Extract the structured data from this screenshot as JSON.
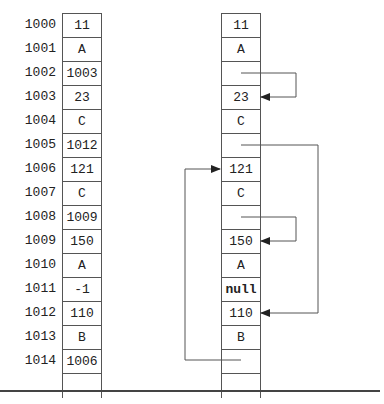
{
  "diagram": {
    "title": "",
    "addresses": [
      "1000",
      "1001",
      "1002",
      "1003",
      "1004",
      "1005",
      "1006",
      "1007",
      "1008",
      "1009",
      "1010",
      "1011",
      "1012",
      "1013",
      "1014"
    ],
    "left_column": {
      "cells": [
        "11",
        "A",
        "1003",
        "23",
        "C",
        "1012",
        "121",
        "C",
        "1009",
        "150",
        "A",
        "-1",
        "110",
        "B",
        "1006"
      ]
    },
    "right_column": {
      "cells": [
        "11",
        "A",
        "",
        "23",
        "C",
        "",
        "121",
        "C",
        "",
        "150",
        "A",
        "null",
        "110",
        "B",
        ""
      ],
      "pointers": [
        {
          "from_address": "1002",
          "to_address": "1003",
          "side": "right"
        },
        {
          "from_address": "1005",
          "to_address": "1012",
          "side": "right"
        },
        {
          "from_address": "1008",
          "to_address": "1009",
          "side": "right"
        },
        {
          "from_address": "1014",
          "to_address": "1006",
          "side": "left"
        }
      ]
    },
    "colors": {
      "line": "#555555",
      "text": "#222222",
      "rule": "#444444"
    }
  }
}
